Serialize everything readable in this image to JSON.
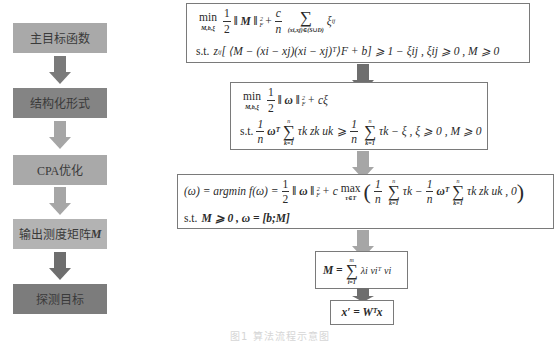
{
  "left_flow": {
    "steps": [
      {
        "label": "主目标函数",
        "color": "#a9a9a9"
      },
      {
        "label": "结构化形式",
        "color": "#848484"
      },
      {
        "label": "CPA优化",
        "color": "#a9a9a9"
      },
      {
        "label": "输出测度矩阵",
        "label_bold": "M",
        "color": "#b3b3b3"
      },
      {
        "label": "探测目标",
        "color": "#7c7c7c"
      }
    ],
    "arrows": [
      {
        "color": "#7a7a7a"
      },
      {
        "color": "#a6a6a6"
      },
      {
        "color": "#a6a6a6"
      },
      {
        "color": "#6e6e6e"
      }
    ]
  },
  "right_flow": {
    "box1": {
      "line1": {
        "min": "min",
        "min_sub": "M,b,ξ",
        "half_num": "1",
        "half_den": "2",
        "norm": "‖ M ‖",
        "norm_sup": "2",
        "norm_sub": "F",
        "plus": "+",
        "c_num": "c",
        "c_den": "n",
        "sum_sub": "(xi,xj)∈(S∪D)",
        "xi": "ξ",
        "xi_sub": "ij"
      },
      "line2": {
        "st": "s.t.",
        "z": "z",
        "z_sub": "ij",
        "body": "[ ⟨M − (xi − xj)(xi − xj)ᵀ⟩F + b] ⩾ 1 − ξij , ξij ⩾ 0 , M ⩾ 0"
      }
    },
    "box2": {
      "line1": {
        "min": "min",
        "min_sub": "M,b,ξ",
        "half_num": "1",
        "half_den": "2",
        "norm": "‖ ω ‖",
        "norm_sup": "2",
        "norm_sub": "F",
        "rest": "+ cξ"
      },
      "line2": {
        "st": "s.t.",
        "frac_num": "1",
        "frac_den": "n",
        "omega_t": "ωᵀ",
        "sum_top": "n",
        "sum_sub": "k=1",
        "term": "τk zk uk",
        "geq": "⩾",
        "frac2_num": "1",
        "frac2_den": "n",
        "sum2_top": "n",
        "sum2_sub": "k=1",
        "rest": "τk − ξ , ξ ⩾ 0 , M ⩾ 0"
      }
    },
    "box3": {
      "line1": {
        "lhs": "(ω) = argmin f(ω) =",
        "argmin_sub": "ω",
        "half_num": "1",
        "half_den": "2",
        "norm": "‖ ω ‖",
        "norm_sup": "2",
        "norm_sub": "F",
        "plus_c": "+ c",
        "max": "max",
        "max_sub": "τ∈T",
        "frac_num": "1",
        "frac_den": "n",
        "sum_top": "n",
        "sum_sub": "k=1",
        "term1": "τk −",
        "frac2_num": "1",
        "frac2_den": "n",
        "omega_t": "ωᵀ",
        "sum2_top": "n",
        "sum2_sub": "k=1",
        "term2": "τk zk uk , 0"
      },
      "line2": {
        "st": "s.t.",
        "body": "M ⩾ 0 , ω = [b;M]"
      }
    },
    "box4": {
      "lhs": "M =",
      "sum_top": "m",
      "sum_sub": "i=1",
      "term": "λi viᵀ vi"
    },
    "box5": {
      "formula": "x′ = Wᵀx"
    },
    "arrows": [
      {
        "color": "#6e6e6e"
      },
      {
        "color": "#a6a6a6"
      },
      {
        "color": "#a6a6a6"
      },
      {
        "color": "#6e6e6e"
      }
    ]
  },
  "caption": "图1 算法流程示意图"
}
